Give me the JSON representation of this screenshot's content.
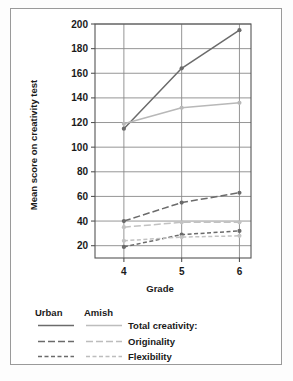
{
  "chart_data": {
    "type": "line",
    "title": "",
    "xlabel": "Grade",
    "ylabel": "Mean score on creativity test",
    "categories": [
      "4",
      "5",
      "6"
    ],
    "x": [
      4,
      5,
      6
    ],
    "xlim": [
      3.5,
      6.2
    ],
    "ylim": [
      10,
      200
    ],
    "yticks": [
      20,
      40,
      60,
      80,
      100,
      120,
      140,
      160,
      180,
      200
    ],
    "ytick_labels": [
      "20",
      "40",
      "60",
      "80",
      "100",
      "120",
      "140",
      "160",
      "180",
      "200"
    ],
    "xticks": [
      4,
      5,
      6
    ],
    "xtick_labels": [
      "4",
      "5",
      "6"
    ],
    "grid": "horizontal-and-vertical",
    "legend_position": "below-plot",
    "series": [
      {
        "name": "Urban Total creativity",
        "group": "Urban",
        "measure": "Total creativity:",
        "style": "solid",
        "color": "#6b6b6b",
        "values": [
          115,
          164,
          195
        ]
      },
      {
        "name": "Amish Total creativity",
        "group": "Amish",
        "measure": "Total creativity:",
        "style": "solid",
        "color": "#b8b8b8",
        "values": [
          119,
          132,
          136
        ]
      },
      {
        "name": "Urban Originality",
        "group": "Urban",
        "measure": "Originality",
        "style": "long-dash",
        "color": "#6b6b6b",
        "values": [
          40,
          55,
          63
        ]
      },
      {
        "name": "Amish Originality",
        "group": "Amish",
        "measure": "Originality",
        "style": "long-dash",
        "color": "#c2c2c2",
        "values": [
          35,
          39,
          39
        ]
      },
      {
        "name": "Urban Flexibility",
        "group": "Urban",
        "measure": "Flexibility",
        "style": "short-dash",
        "color": "#6b6b6b",
        "values": [
          19,
          29,
          32
        ]
      },
      {
        "name": "Amish Flexibility",
        "group": "Amish",
        "measure": "Flexibility",
        "style": "short-dash",
        "color": "#c2c2c2",
        "values": [
          24,
          27,
          28
        ]
      }
    ]
  },
  "legend": {
    "column_urban": "Urban",
    "column_amish": "Amish",
    "rows": [
      {
        "label": "Total creativity:",
        "style": "solid"
      },
      {
        "label": "Originality",
        "style": "long-dash"
      },
      {
        "label": "Flexibility",
        "style": "short-dash"
      }
    ]
  },
  "colors": {
    "urban": "#6b6b6b",
    "amish": "#bdbdbd",
    "grid": "#8a8a8a",
    "frame": "#555555",
    "text": "#1a1a1a",
    "page_border": "#9a9a9a",
    "background": "#ffffff"
  }
}
